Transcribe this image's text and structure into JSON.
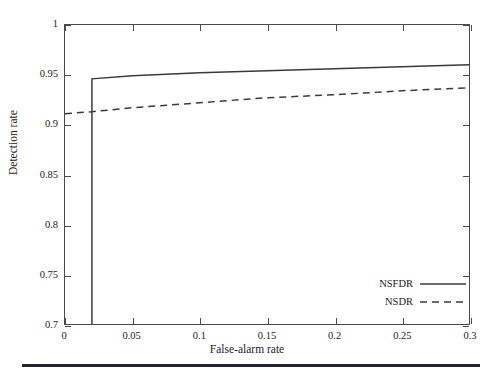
{
  "chart_data": {
    "type": "line",
    "title": "",
    "xlabel": "False-alarm rate",
    "ylabel": "Detection rate",
    "xlim": [
      0,
      0.3
    ],
    "ylim": [
      0.7,
      1.0
    ],
    "xticks": [
      "0",
      "0.05",
      "0.1",
      "0.15",
      "0.2",
      "0.25",
      "0.3"
    ],
    "xtick_values": [
      0,
      0.05,
      0.1,
      0.15,
      0.2,
      0.25,
      0.3
    ],
    "yticks": [
      "0.7",
      "0.75",
      "0.8",
      "0.85",
      "0.9",
      "0.95",
      "1"
    ],
    "ytick_values": [
      0.7,
      0.75,
      0.8,
      0.85,
      0.9,
      0.95,
      1.0
    ],
    "grid": false,
    "legend_position": "lower right",
    "series": [
      {
        "name": "NSFDR",
        "style": "solid",
        "color": "#3a3a3a",
        "x": [
          0.02,
          0.02,
          0.05,
          0.1,
          0.15,
          0.2,
          0.25,
          0.3
        ],
        "y": [
          0.7,
          0.946,
          0.949,
          0.952,
          0.954,
          0.956,
          0.958,
          0.96
        ]
      },
      {
        "name": "NSDR",
        "style": "dashed",
        "color": "#3a3a3a",
        "x": [
          0.0,
          0.02,
          0.05,
          0.1,
          0.15,
          0.2,
          0.25,
          0.3
        ],
        "y": [
          0.911,
          0.913,
          0.917,
          0.922,
          0.927,
          0.93,
          0.934,
          0.937
        ]
      }
    ]
  },
  "legend": {
    "items": [
      {
        "label": "NSFDR",
        "style": "solid"
      },
      {
        "label": "NSDR",
        "style": "dashed"
      }
    ]
  },
  "axes": {
    "x_title": "False-alarm rate",
    "y_title": "Detection rate"
  }
}
